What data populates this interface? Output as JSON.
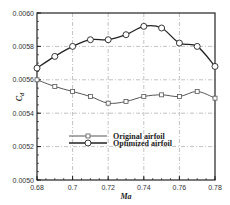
{
  "chart_data": {
    "type": "line",
    "title": "",
    "xlabel": "Ma",
    "ylabel": "C_d",
    "xlim": [
      0.68,
      0.78
    ],
    "ylim": [
      0.005,
      0.006
    ],
    "grid": true,
    "legend_position": "inside-lower-center",
    "x_ticks": [
      "0.68",
      "0.7",
      "0.72",
      "0.74",
      "0.76",
      "0.78"
    ],
    "y_ticks": [
      "0.0050",
      "0.0052",
      "0.0054",
      "0.0056",
      "0.0058",
      "0.0060"
    ],
    "x": [
      0.68,
      0.69,
      0.7,
      0.71,
      0.72,
      0.73,
      0.74,
      0.75,
      0.76,
      0.77,
      0.78
    ],
    "series": [
      {
        "name": "Original airfoil",
        "marker": "square",
        "values": [
          0.0056,
          0.00556,
          0.00553,
          0.0055,
          0.00546,
          0.00547,
          0.0055,
          0.00551,
          0.0055,
          0.00553,
          0.00549
        ]
      },
      {
        "name": "Optimized airfoil",
        "marker": "circle",
        "values": [
          0.00567,
          0.00574,
          0.0058,
          0.00584,
          0.00584,
          0.00587,
          0.00592,
          0.00591,
          0.00582,
          0.0058,
          0.00568
        ]
      }
    ]
  }
}
